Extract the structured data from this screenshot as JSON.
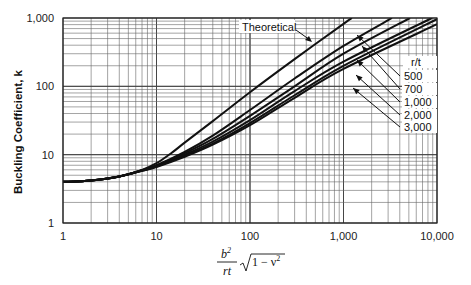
{
  "chart_data": {
    "type": "line",
    "title": "",
    "xlabel": "b²/rt √(1 − ν²)",
    "xlabel_parts": {
      "numerator": "b",
      "numerator_sup": "2",
      "denominator": "rt",
      "radical": "1 − ν",
      "radical_sup": "2"
    },
    "ylabel": "Buckling Coefficient, k",
    "xscale": "log",
    "yscale": "log",
    "xlim": [
      1,
      10000
    ],
    "ylim": [
      1,
      1000
    ],
    "grid": true,
    "x_ticks": [
      1,
      10,
      100,
      1000,
      10000
    ],
    "x_tick_labels": [
      "1",
      "10",
      "100",
      "1,000",
      "10,000"
    ],
    "y_ticks": [
      1,
      10,
      100,
      1000
    ],
    "y_tick_labels": [
      "1",
      "10",
      "100",
      "1,000"
    ],
    "legend": {
      "title": "r/t",
      "position": "right, inline with curves",
      "entries": [
        "500",
        "700",
        "1,000",
        "2,000",
        "3,000"
      ]
    },
    "annotations": [
      {
        "text": "Theoretical",
        "arrow_to_series": "Theoretical"
      }
    ],
    "series": [
      {
        "name": "Theoretical",
        "x": [
          1,
          2,
          4,
          7,
          10,
          15,
          20,
          40,
          100,
          300,
          1000,
          1230
        ],
        "y": [
          4.0,
          4.2,
          4.8,
          6.0,
          7.5,
          11,
          15,
          31,
          82,
          250,
          820,
          1000
        ]
      },
      {
        "name": "500",
        "x": [
          1,
          2,
          4,
          7,
          10,
          20,
          40,
          100,
          300,
          1000,
          3300
        ],
        "y": [
          4.0,
          4.2,
          4.8,
          5.9,
          7.0,
          11,
          19,
          45,
          130,
          390,
          1000
        ]
      },
      {
        "name": "700",
        "x": [
          1,
          2,
          4,
          7,
          10,
          20,
          40,
          100,
          300,
          1000,
          5150
        ],
        "y": [
          4.0,
          4.2,
          4.8,
          5.9,
          6.9,
          10.5,
          17,
          37,
          100,
          300,
          1000
        ]
      },
      {
        "name": "1,000",
        "x": [
          1,
          2,
          4,
          7,
          10,
          20,
          40,
          100,
          300,
          1000,
          8850
        ],
        "y": [
          4.0,
          4.2,
          4.8,
          5.9,
          6.8,
          10,
          15.5,
          32,
          85,
          230,
          1000
        ]
      },
      {
        "name": "2,000",
        "x": [
          1,
          2,
          4,
          7,
          10,
          20,
          40,
          100,
          300,
          1000,
          10000
        ],
        "y": [
          4.0,
          4.2,
          4.8,
          5.8,
          6.7,
          9.6,
          14.5,
          29,
          74,
          200,
          960
        ]
      },
      {
        "name": "3,000",
        "x": [
          1,
          2,
          4,
          7,
          10,
          20,
          40,
          100,
          300,
          1000,
          10000
        ],
        "y": [
          4.0,
          4.2,
          4.8,
          5.8,
          6.6,
          9.3,
          14,
          27,
          68,
          180,
          810
        ]
      }
    ]
  }
}
